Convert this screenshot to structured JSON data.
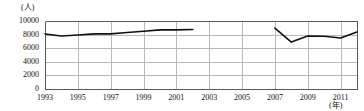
{
  "chart_data": {
    "type": "line",
    "title": "",
    "xlabel": "(年)",
    "ylabel": "(人)",
    "ylim": [
      0,
      10000
    ],
    "xlim": [
      1993,
      2012
    ],
    "grid": true,
    "legend": "none",
    "y_ticks": [
      0,
      2000,
      4000,
      6000,
      8000,
      10000
    ],
    "y_tick_labels": [
      "0",
      "2000",
      "4000",
      "6000",
      "8000",
      "10000"
    ],
    "x_ticks": [
      1993,
      1995,
      1997,
      1999,
      2001,
      2003,
      2005,
      2007,
      2009,
      2011
    ],
    "x_tick_labels": [
      "1993",
      "1995",
      "1997",
      "1999",
      "2001",
      "2003",
      "2005",
      "2007",
      "2009",
      "2011"
    ],
    "series": [
      {
        "name": "segment-1",
        "x": [
          1993,
          1994,
          1995,
          1996,
          1997,
          1998,
          1999,
          2000,
          2001,
          2002
        ],
        "values": [
          8100,
          7800,
          7950,
          8100,
          8100,
          8300,
          8500,
          8700,
          8700,
          8750
        ]
      },
      {
        "name": "segment-2",
        "x": [
          2007,
          2008,
          2009,
          2010,
          2011,
          2012
        ],
        "values": [
          8950,
          6900,
          7800,
          7750,
          7500,
          8400
        ]
      }
    ],
    "style": {
      "line_color": "#111111",
      "marker": "diamond",
      "marker_color": "#111111",
      "grid_color": "#b9b9b9",
      "axis_color": "#5a5a5a",
      "background": "#ffffff"
    }
  }
}
